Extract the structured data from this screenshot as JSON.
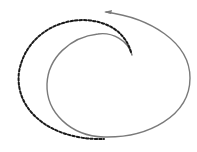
{
  "diagram": {
    "type": "spiral-path",
    "background": "#ffffff",
    "solid_path": {
      "color": "#7a7a7a",
      "stroke_width": 1.4,
      "d": "M132,55 C128,40 112,32 98,34 C70,37 48,58 47,84 C46,112 70,136 104,137 C148,138 190,116 190,78 C190,42 150,18 106,12"
    },
    "arrowhead": {
      "color": "#7a7a7a",
      "points": "104,12 112,10 111,14"
    },
    "dashed_path": {
      "color": "#1a1a1a",
      "stroke_width": 2,
      "dash": "2.5,2",
      "d": "M131,52 C125,32 108,21 84,20 C50,20 24,42 19,72 C15,104 40,130 78,137 C88,139 96,139 104,139"
    }
  }
}
